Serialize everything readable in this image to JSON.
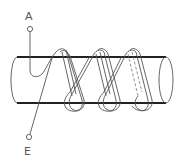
{
  "diagram": {
    "type": "coil-wound-cylinder",
    "terminals": [
      {
        "label": "A",
        "position": "top-left"
      },
      {
        "label": "E",
        "position": "bottom-left"
      }
    ],
    "turns": 3,
    "colors": {
      "line": "#555555",
      "cylinder_edge": "#222222",
      "background": "#ffffff"
    }
  }
}
